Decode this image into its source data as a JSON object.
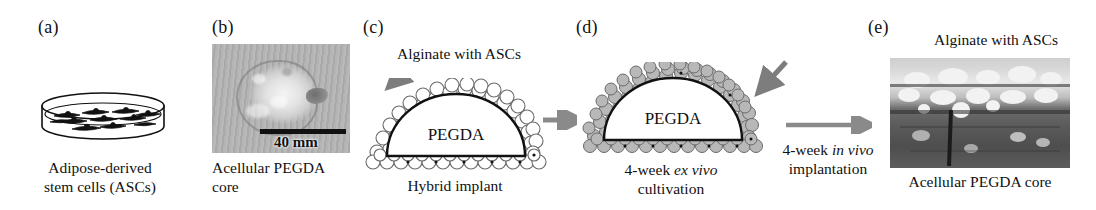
{
  "figure": {
    "type": "multi-panel-scientific-figure",
    "panel_count": 5,
    "background": "#ffffff",
    "text_color": "#111111",
    "arrow_color": "#808080"
  },
  "panels": {
    "a": {
      "letter": "(a)",
      "caption_line1": "Adipose-derived",
      "caption_line2": "stem cells (ASCs)",
      "illustration": "petri-dish-with-spindle-cells",
      "cell_count": 12
    },
    "b": {
      "letter": "(b)",
      "caption_line1": "Acellular PEGDA",
      "caption_line2": "core",
      "illustration": "grayscale-photograph",
      "scale_bar_label": "40 mm"
    },
    "c": {
      "letter": "(c)",
      "top_label": "Alginate with ASCs",
      "dome_label": "PEGDA",
      "caption": "Hybrid implant",
      "illustration": "dome-with-white-alginate-beads",
      "bead_fill": "#ffffff"
    },
    "d": {
      "letter": "(d)",
      "dome_label": "PEGDA",
      "caption_line1_pre": "4-week ",
      "caption_line1_em": "ex vivo",
      "caption_line2": "cultivation",
      "illustration": "dome-with-gray-alginate-beads",
      "bead_fill": "#b5b5b5"
    },
    "e": {
      "letter": "(e)",
      "top_label": "Alginate with ASCs",
      "caption": "Acellular PEGDA core",
      "illustration": "histology-section-micrograph"
    }
  },
  "arrows": {
    "c_to_d": {
      "name": "process-arrow",
      "label": ""
    },
    "d_to_e": {
      "name": "process-arrow",
      "label_pre": "4-week ",
      "label_em": "in vivo",
      "label_post": "implantation"
    },
    "c_pointer": {
      "name": "alginate-pointer-arrow"
    },
    "e_pointer": {
      "name": "alginate-pointer-arrow"
    }
  }
}
